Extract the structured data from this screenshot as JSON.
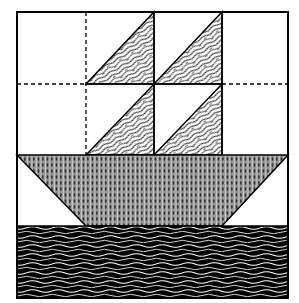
{
  "diagram": {
    "type": "quilt-block",
    "subject": "sailboat",
    "grid": {
      "columns": 4,
      "rows": 4
    },
    "bounds": {
      "x": 17,
      "y": 12,
      "width": 271,
      "height": 286
    },
    "colors": {
      "background": "#ffffff",
      "outline": "#000000",
      "hull_base": "#9a9a9a",
      "hull_dots": "#1a1a1a",
      "water_base": "#000000",
      "water_waves": "#ffffff",
      "sail_base": "#ffffff",
      "sail_strands": "#000000"
    },
    "pieces": [
      {
        "name": "sail",
        "fabric": "white with black wavy strands",
        "cell": [
          1,
          0
        ]
      },
      {
        "name": "sail",
        "fabric": "white with black wavy strands",
        "cell": [
          2,
          0
        ]
      },
      {
        "name": "sail",
        "fabric": "white with black wavy strands",
        "cell": [
          1,
          1
        ]
      },
      {
        "name": "sail",
        "fabric": "white with black wavy strands",
        "cell": [
          2,
          1
        ]
      },
      {
        "name": "hull",
        "fabric": "grey with dark diamond dots",
        "shape": "trapezoid",
        "row": 2
      },
      {
        "name": "water",
        "fabric": "black with white waves",
        "row": 3
      }
    ],
    "seam_lines": "dashed"
  }
}
